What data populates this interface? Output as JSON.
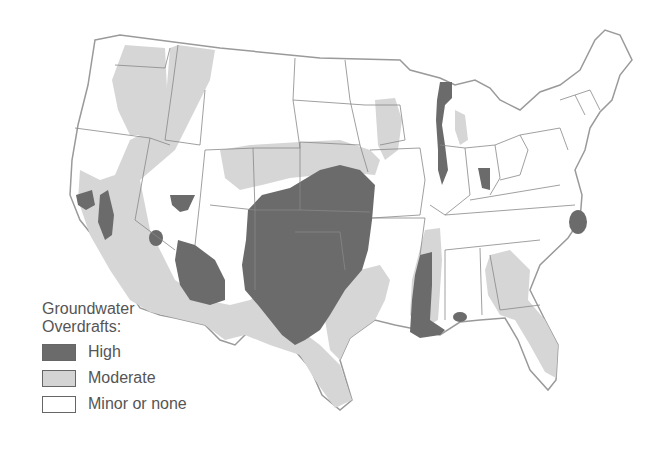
{
  "legend": {
    "title_line1": "Groundwater",
    "title_line2": "Overdrafts:",
    "items": [
      {
        "label": "High",
        "color": "#6b6b6b"
      },
      {
        "label": "Moderate",
        "color": "#d4d4d4"
      },
      {
        "label": "Minor or none",
        "color": "#ffffff"
      }
    ]
  },
  "map": {
    "subject": "Contiguous United States groundwater overdraft levels",
    "colors": {
      "high": "#6b6b6b",
      "moderate": "#d6d6d6",
      "none": "#ffffff",
      "border": "#8a8a8a"
    }
  }
}
